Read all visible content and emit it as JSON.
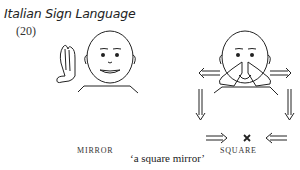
{
  "header": {
    "title": "Italian Sign Language",
    "example_number": "(20)"
  },
  "signs": [
    {
      "label": "MIRROR",
      "icon": "signer-mirror-illustration"
    },
    {
      "label": "SQUARE",
      "icon": "signer-square-illustration"
    }
  ],
  "gloss": "‘a square mirror’"
}
